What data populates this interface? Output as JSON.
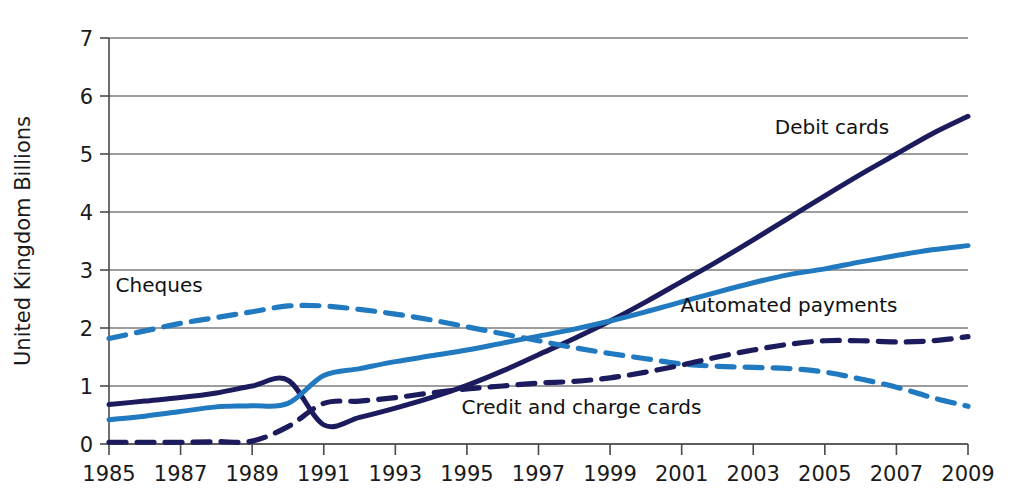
{
  "chart_data": {
    "type": "line",
    "title": "",
    "subtitle": "",
    "xlabel": "",
    "ylabel": "United Kingdom Billions",
    "xlim": [
      1985,
      2009
    ],
    "ylim": [
      0,
      7
    ],
    "yticks": [
      0,
      1,
      2,
      3,
      4,
      5,
      6,
      7
    ],
    "ytick_labels": [
      "0",
      "1",
      "2",
      "3",
      "4",
      "5",
      "6",
      "7"
    ],
    "xticks": [
      1985,
      1987,
      1989,
      1991,
      1993,
      1995,
      1997,
      1999,
      2001,
      2003,
      2005,
      2007,
      2009
    ],
    "xtick_labels": [
      "1985",
      "1987",
      "1989",
      "1991",
      "1993",
      "1995",
      "1997",
      "1999",
      "2001",
      "2003",
      "2005",
      "2007",
      "2009"
    ],
    "grid": "horizontal",
    "legend_position": "inline-annotations",
    "x": [
      1985,
      1986,
      1987,
      1988,
      1989,
      1990,
      1991,
      1992,
      1993,
      1994,
      1995,
      1996,
      1997,
      1998,
      1999,
      2000,
      2001,
      2002,
      2003,
      2004,
      2005,
      2006,
      2007,
      2008,
      2009
    ],
    "series": [
      {
        "name": "Debit cards",
        "label": "Debit cards",
        "color": "#1b1b5e",
        "style": "solid",
        "label_x": 2005.2,
        "label_y": 5.35,
        "values": [
          0.68,
          0.74,
          0.8,
          0.88,
          1.0,
          1.1,
          0.33,
          0.46,
          0.62,
          0.8,
          1.01,
          1.26,
          1.54,
          1.82,
          2.12,
          2.45,
          2.8,
          3.15,
          3.52,
          3.9,
          4.28,
          4.65,
          5.0,
          5.35,
          5.65
        ]
      },
      {
        "name": "Automated payments",
        "label": "Automated payments",
        "color": "#2179c0",
        "style": "solid",
        "label_x": 2004.0,
        "label_y": 2.28,
        "values": [
          0.42,
          0.48,
          0.56,
          0.64,
          0.66,
          0.7,
          1.18,
          1.3,
          1.42,
          1.52,
          1.62,
          1.74,
          1.86,
          1.98,
          2.12,
          2.28,
          2.45,
          2.62,
          2.78,
          2.92,
          3.02,
          3.14,
          3.25,
          3.35,
          3.42
        ]
      },
      {
        "name": "Cheques",
        "label": "Cheques",
        "color": "#2179c0",
        "style": "dashed",
        "label_x": 1986.4,
        "label_y": 2.62,
        "values": [
          1.82,
          1.95,
          2.08,
          2.18,
          2.28,
          2.38,
          2.38,
          2.32,
          2.24,
          2.14,
          2.02,
          1.9,
          1.78,
          1.66,
          1.56,
          1.47,
          1.38,
          1.34,
          1.32,
          1.3,
          1.24,
          1.12,
          0.98,
          0.8,
          0.65
        ]
      },
      {
        "name": "Credit and charge cards",
        "label": "Credit and charge cards",
        "color": "#1b1b5e",
        "style": "dashed",
        "label_x": 1998.2,
        "label_y": 0.52,
        "values": [
          0.03,
          0.03,
          0.03,
          0.04,
          0.05,
          0.3,
          0.7,
          0.74,
          0.8,
          0.88,
          0.95,
          1.0,
          1.05,
          1.08,
          1.14,
          1.24,
          1.36,
          1.5,
          1.62,
          1.72,
          1.78,
          1.78,
          1.76,
          1.78,
          1.85
        ]
      }
    ]
  }
}
